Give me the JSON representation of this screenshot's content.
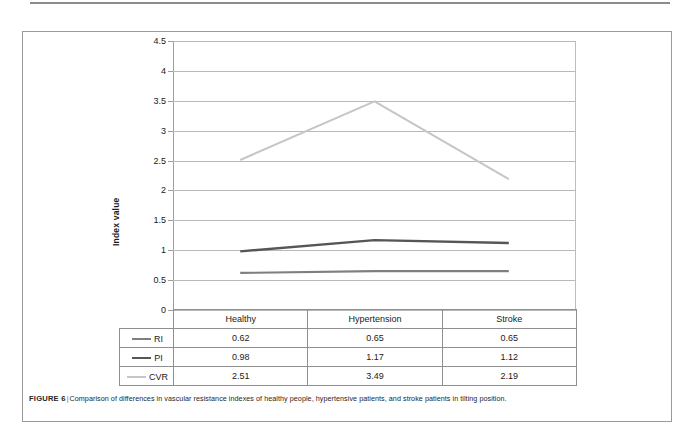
{
  "figure": {
    "caption_label": "FIGURE 6",
    "caption_separator": "|",
    "caption_text": "Comparison of differences in vascular resistance indexes of healthy people, hypertensive patients, and stroke patients in tilting position."
  },
  "chart_data": {
    "type": "line",
    "title": "",
    "xlabel": "",
    "ylabel": "Index value",
    "categories": [
      "Healthy",
      "Hypertension",
      "Stroke"
    ],
    "series": [
      {
        "name": "RI",
        "values": [
          0.62,
          0.65,
          0.65
        ],
        "color": "#7f7f7f"
      },
      {
        "name": "PI",
        "values": [
          0.98,
          1.17,
          1.12
        ],
        "color": "#565656"
      },
      {
        "name": "CVR",
        "values": [
          2.51,
          3.49,
          2.19
        ],
        "color": "#c6c6c6"
      }
    ],
    "ylim": [
      0,
      4.5
    ],
    "ytick_labels": [
      "0",
      "0.5",
      "1",
      "1.5",
      "2",
      "2.5",
      "3",
      "3.5",
      "4",
      "4.5"
    ],
    "ytick_values": [
      0,
      0.5,
      1,
      1.5,
      2,
      2.5,
      3,
      3.5,
      4,
      4.5
    ],
    "grid": true,
    "legend_position": "data-table-left",
    "data_table": {
      "corner_label": "",
      "column_headers": [
        "Healthy",
        "Hypertension",
        "Stroke"
      ],
      "rows": [
        {
          "label": "RI",
          "cells": [
            "0.62",
            "0.65",
            "0.65"
          ],
          "color": "#7f7f7f"
        },
        {
          "label": "PI",
          "cells": [
            "0.98",
            "1.17",
            "1.12"
          ],
          "color": "#565656"
        },
        {
          "label": "CVR",
          "cells": [
            "2.51",
            "3.49",
            "2.19"
          ],
          "color": "#c6c6c6"
        }
      ]
    }
  }
}
